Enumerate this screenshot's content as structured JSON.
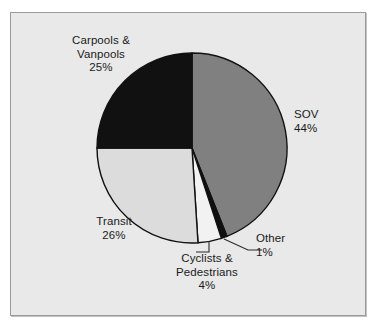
{
  "chart_data": {
    "type": "pie",
    "title": "",
    "subtitle": "",
    "xlabel": "",
    "ylabel": "",
    "legend_position": "none",
    "grid": false,
    "labels_show_percent": true,
    "start_angle_deg": 0,
    "direction": "clockwise",
    "categories": [
      "SOV",
      "Other",
      "Cyclists & Pedestrians",
      "Transit",
      "Carpools & Vanpools"
    ],
    "values": [
      44,
      1,
      4,
      26,
      25
    ],
    "units": "percent",
    "total": 100,
    "slices": [
      {
        "name": "SOV",
        "label_line1": "SOV",
        "label_line2": "44%",
        "value": 44,
        "percent_text": "44%",
        "color": "#808080",
        "has_leader_line": false
      },
      {
        "name": "Other",
        "label_line1": "Other",
        "label_line2": "1%",
        "value": 1,
        "percent_text": "1%",
        "color": "#101010",
        "has_leader_line": true
      },
      {
        "name": "Cyclists & Pedestrians",
        "label_line1": "Cyclists &",
        "label_line2": "Pedestrians",
        "label_line3": "4%",
        "value": 4,
        "percent_text": "4%",
        "color": "#f2f2f2",
        "has_leader_line": true
      },
      {
        "name": "Transit",
        "label_line1": "Transit",
        "label_line2": "26%",
        "value": 26,
        "percent_text": "26%",
        "color": "#dcdcdc",
        "has_leader_line": false
      },
      {
        "name": "Carpools & Vanpools",
        "label_line1": "Carpools &",
        "label_line2": "Vanpools",
        "label_line3": "25%",
        "value": 25,
        "percent_text": "25%",
        "color": "#111111",
        "has_leader_line": false
      }
    ]
  },
  "figure": {
    "background_color": "#e9e9e9",
    "border_color": "#9a9a9a",
    "slice_outline_color": "#111111"
  }
}
